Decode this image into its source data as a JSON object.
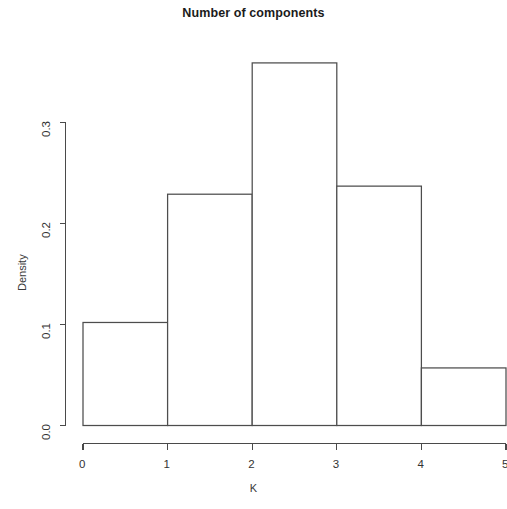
{
  "chart_data": {
    "type": "bar",
    "title": "Number of components",
    "xlabel": "K",
    "ylabel": "Density",
    "categories": [
      "0-1",
      "1-2",
      "2-3",
      "3-4",
      "4-5"
    ],
    "bin_edges": [
      0,
      1,
      2,
      3,
      4,
      5
    ],
    "values": [
      0.102,
      0.229,
      0.359,
      0.237,
      0.057
    ],
    "xlim": [
      0,
      5
    ],
    "ylim": [
      0.0,
      0.37
    ],
    "xticks": [
      "0",
      "1",
      "2",
      "3",
      "4",
      "5"
    ],
    "xtick_values": [
      0,
      1,
      2,
      3,
      4,
      5
    ],
    "yticks": [
      "0.0",
      "0.1",
      "0.2",
      "0.3"
    ],
    "ytick_values": [
      0.0,
      0.1,
      0.2,
      0.3
    ],
    "grid": false,
    "legend": false,
    "bar_fill": "#ffffff",
    "bar_stroke": "#4d4d4d",
    "axis_color": "#4a4a4a",
    "background": "#ffffff"
  }
}
